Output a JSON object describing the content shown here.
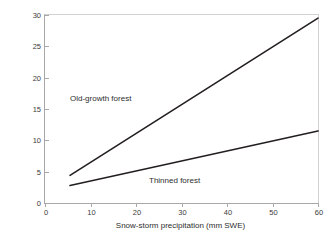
{
  "chart_data": {
    "type": "line",
    "title": "",
    "xlabel": "Snow-storm precipitation (mm SWE)",
    "ylabel": "Snow-storm interception (mm SWE)",
    "xlim": [
      0,
      60
    ],
    "ylim": [
      0,
      30
    ],
    "xticks": [
      0,
      10,
      20,
      30,
      40,
      50,
      60
    ],
    "yticks": [
      0,
      5,
      10,
      15,
      20,
      25,
      30
    ],
    "xtick_labels": [
      "0",
      "10",
      "20",
      "30",
      "40",
      "50",
      "60"
    ],
    "ytick_labels": [
      "0",
      "5",
      "10",
      "15",
      "20",
      "25",
      "30"
    ],
    "grid": false,
    "legend": "in-plot annotations",
    "line_color": "#231f20",
    "axis_color": "#a8a8a8",
    "text_color": "#2e2e2e",
    "series": [
      {
        "name": "Old-growth forest",
        "color": "#231f20",
        "x": [
          5.5,
          60
        ],
        "values": [
          4.4,
          29.5
        ],
        "annotation": "Old-growth forest"
      },
      {
        "name": "Thinned forest",
        "color": "#231f20",
        "x": [
          5.5,
          60
        ],
        "values": [
          2.8,
          11.5
        ],
        "annotation": "Thinned forest"
      }
    ]
  }
}
